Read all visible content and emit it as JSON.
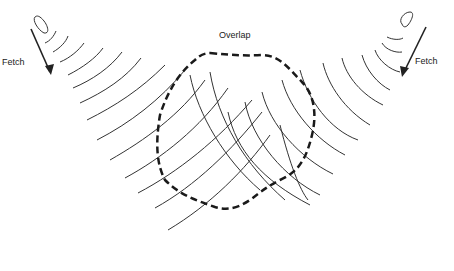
{
  "diagram": {
    "title_label": "Overlap",
    "left_label": "Fetch",
    "right_label": "Fetch",
    "colors": {
      "line": "#333333",
      "dashed": "#1a1a1a",
      "background": "#ffffff"
    },
    "elements": {
      "left_source": "storm source (left)",
      "right_source": "storm source (right)",
      "left_arrow": "fetch arrow (left, pointing down-right)",
      "right_arrow": "fetch arrow (right, pointing down-left)",
      "overlap_region": "dashed boundary of wave overlap"
    }
  }
}
